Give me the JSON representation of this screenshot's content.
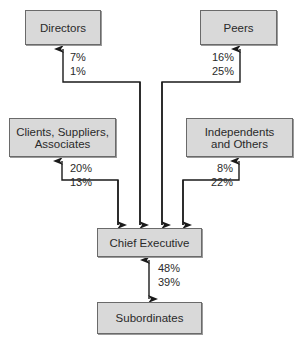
{
  "diagram": {
    "nodes": {
      "directors": {
        "label": "Directors"
      },
      "peers": {
        "label": "Peers"
      },
      "clients": {
        "label": "Clients, Suppliers, Associates"
      },
      "independents": {
        "label": "Independents and Others"
      },
      "chief_executive": {
        "label": "Chief Executive"
      },
      "subordinates": {
        "label": "Subordinates"
      }
    },
    "edges": {
      "directors": {
        "top": "7%",
        "bottom": "1%"
      },
      "peers": {
        "top": "16%",
        "bottom": "25%"
      },
      "clients": {
        "top": "20%",
        "bottom": "13%"
      },
      "independents": {
        "top": "8%",
        "bottom": "22%"
      },
      "subordinates": {
        "top": "48%",
        "bottom": "39%"
      }
    },
    "colors": {
      "box_fill": "#d9d9d9",
      "box_border": "#6a6a6a",
      "line": "#1a1a1a"
    }
  }
}
